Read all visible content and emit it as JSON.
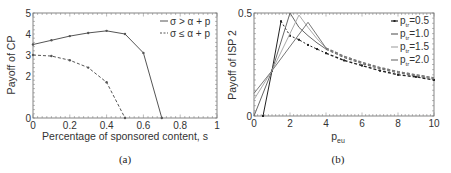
{
  "chart_data": [
    {
      "id": "a",
      "type": "line",
      "caption": "(a)",
      "title": "",
      "xlabel": "Percentage of sponsored content, s",
      "ylabel": "Payoff of CP",
      "xlim": [
        0,
        1
      ],
      "ylim": [
        0,
        5
      ],
      "xticks": [
        0,
        0.2,
        0.4,
        0.6,
        0.8,
        1
      ],
      "xtick_labels": [
        "0",
        "0.2",
        "0.4",
        "0.6",
        "0.8",
        "1"
      ],
      "yticks": [
        0,
        2,
        3,
        4,
        5
      ],
      "ytick_labels": [
        "0",
        "2",
        "3",
        "4",
        "5"
      ],
      "legend_position": "top-right",
      "series": [
        {
          "name": "σ > α + p",
          "style": "solid",
          "color": "#555555",
          "x": [
            0,
            0.1,
            0.2,
            0.3,
            0.4,
            0.5,
            0.6,
            0.7
          ],
          "y": [
            3.5,
            3.7,
            3.9,
            4.05,
            4.15,
            4.0,
            3.1,
            0
          ]
        },
        {
          "name": "σ ≤ α + p",
          "style": "dashed",
          "color": "#555555",
          "x": [
            0,
            0.1,
            0.2,
            0.3,
            0.4,
            0.5
          ],
          "y": [
            3.0,
            2.95,
            2.75,
            2.4,
            1.7,
            0
          ]
        }
      ]
    },
    {
      "id": "b",
      "type": "line",
      "caption": "(b)",
      "title": "",
      "xlabel": "p",
      "xlabel_sub": "eu",
      "ylabel": "Payoff of ISP 2",
      "xlim": [
        0,
        10
      ],
      "ylim": [
        0,
        0.5
      ],
      "xticks": [
        0,
        2,
        4,
        6,
        8,
        10
      ],
      "xtick_labels": [
        "0",
        "2",
        "4",
        "6",
        "8",
        "10"
      ],
      "yticks": [
        0,
        0.5
      ],
      "ytick_labels": [
        "0",
        "0.5"
      ],
      "legend_position": "top-right",
      "series": [
        {
          "name": "p_tr=0.5",
          "label_main": "p",
          "label_sub": "tr",
          "label_val": "=0.5",
          "color": "#222222",
          "x": [
            0.5,
            1,
            1.5,
            2,
            2.5,
            3,
            3.5,
            4,
            5,
            6,
            7,
            8,
            9,
            10
          ],
          "y": [
            0,
            0.22,
            0.46,
            0.39,
            0.37,
            0.345,
            0.325,
            0.305,
            0.27,
            0.245,
            0.22,
            0.2,
            0.19,
            0.175
          ]
        },
        {
          "name": "p_tr=1.0",
          "label_main": "p",
          "label_sub": "tr",
          "label_val": "=1.0",
          "color": "#666666",
          "x": [
            0,
            1,
            2,
            2.5,
            3,
            3.5,
            4,
            5,
            6,
            7,
            8,
            9,
            10
          ],
          "y": [
            0,
            0.22,
            0.5,
            0.43,
            0.39,
            0.355,
            0.325,
            0.285,
            0.255,
            0.23,
            0.21,
            0.195,
            0.18
          ]
        },
        {
          "name": "p_tr=1.5",
          "label_main": "p",
          "label_sub": "tr",
          "label_val": "=1.5",
          "color": "#aaaaaa",
          "x": [
            0,
            1,
            2.5,
            3,
            3.5,
            4,
            5,
            6,
            7,
            8,
            9,
            10
          ],
          "y": [
            0.08,
            0.22,
            0.49,
            0.43,
            0.375,
            0.33,
            0.29,
            0.26,
            0.235,
            0.215,
            0.2,
            0.185
          ]
        },
        {
          "name": "p_tr=2.0",
          "label_main": "p",
          "label_sub": "tr",
          "label_val": "=2.0",
          "color": "#777777",
          "x": [
            0,
            1,
            3,
            4,
            5,
            6,
            7,
            8,
            9,
            10
          ],
          "y": [
            0.11,
            0.22,
            0.455,
            0.33,
            0.29,
            0.26,
            0.235,
            0.215,
            0.2,
            0.185
          ]
        }
      ]
    }
  ]
}
